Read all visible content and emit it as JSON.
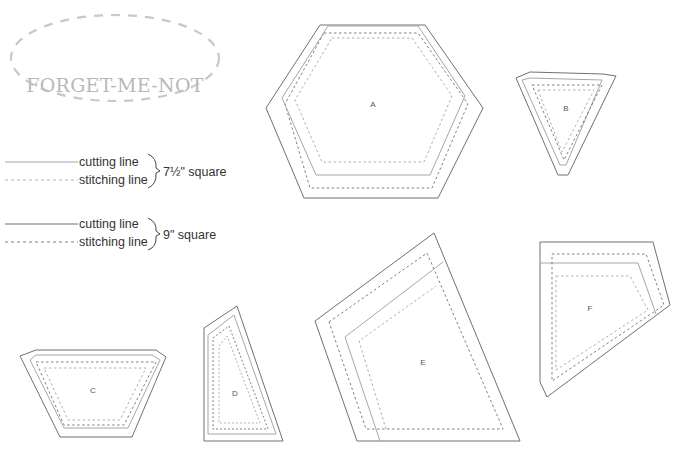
{
  "logo": {
    "text": "FORGET-ME-NOT"
  },
  "legend": {
    "groups": [
      {
        "cutting": "cutting line",
        "stitching": "stitching line",
        "size": "7½\" square"
      },
      {
        "cutting": "cutting line",
        "stitching": "stitching line",
        "size": "9\" square"
      }
    ]
  },
  "pieces": [
    {
      "label": "A"
    },
    {
      "label": "B"
    },
    {
      "label": "C"
    },
    {
      "label": "D"
    },
    {
      "label": "E"
    },
    {
      "label": "F"
    }
  ],
  "colors": {
    "cut_small": "#a6a6a6",
    "stitch_small": "#b0b0b0",
    "cut_large": "#707070",
    "stitch_large": "#808080"
  }
}
